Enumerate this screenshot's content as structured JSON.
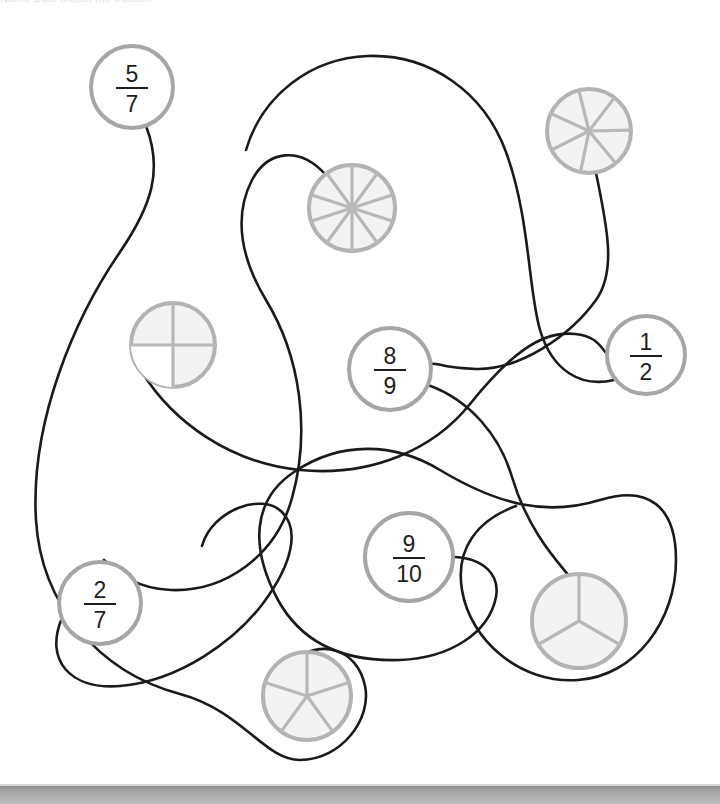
{
  "page": {
    "type": "fraction-matching-worksheet",
    "width": 720,
    "height": 804,
    "background_color": "#ffffff",
    "top_text_fragment": "Name   Date   Match the fraction",
    "bottom_bar_color": "#a9a9a9"
  },
  "style": {
    "connector_color": "#1a1a1a",
    "connector_width": 2.6,
    "fraction_circle_stroke": "#a6a6a6",
    "fraction_circle_fill": "#ffffff",
    "fraction_circle_width": 4,
    "fraction_text_color": "#1d1d1d",
    "pie_fill": "#f3f3f3",
    "pie_stroke": "#b3b3b3",
    "pie_spoke_color": "#b8b8b8",
    "pie_stroke_width": 4
  },
  "fraction_nodes": [
    {
      "id": "f-5-7",
      "label": "5/7",
      "numerator": "5",
      "denominator": "7",
      "cx": 132,
      "cy": 87,
      "r": 41
    },
    {
      "id": "f-1-2",
      "label": "1/2",
      "numerator": "1",
      "denominator": "2",
      "cx": 646,
      "cy": 355,
      "r": 39
    },
    {
      "id": "f-8-9",
      "label": "8/9",
      "numerator": "8",
      "denominator": "9",
      "cx": 390,
      "cy": 369,
      "r": 41
    },
    {
      "id": "f-9-10",
      "label": "9/10",
      "numerator": "9",
      "denominator": "10",
      "cx": 409,
      "cy": 557,
      "r": 44
    },
    {
      "id": "f-2-7",
      "label": "2/7",
      "numerator": "2",
      "denominator": "7",
      "cx": 100,
      "cy": 603,
      "r": 41
    }
  ],
  "pie_nodes": [
    {
      "id": "pie-7",
      "sectors": 7,
      "cx": 589,
      "cy": 131,
      "r": 42,
      "rotation": -14
    },
    {
      "id": "pie-10",
      "sectors": 10,
      "cx": 352,
      "cy": 208,
      "r": 43,
      "rotation": 0
    },
    {
      "id": "pie-4",
      "sectors": 4,
      "cx": 173,
      "cy": 345,
      "r": 42,
      "rotation": 0,
      "shaded_sectors": [
        2
      ]
    },
    {
      "id": "pie-5",
      "sectors": 5,
      "cx": 307,
      "cy": 696,
      "r": 44,
      "rotation": 0
    },
    {
      "id": "pie-3",
      "sectors": 3,
      "cx": 579,
      "cy": 621,
      "r": 47,
      "rotation": 0
    }
  ],
  "connectors": [
    {
      "id": "c-1",
      "from": "f-5-7",
      "to": "pie-5",
      "path": "M 146 126 C 163 170 152 205 120 252 C 76 316 30 420 36 520 C 41 604 98 672 180 694 C 243 711 264 760 300 760 C 342 760 372 718 365 686 C 357 648 320 639 295 660"
    },
    {
      "id": "c-2",
      "from": "pie-10",
      "to": "f-2-7",
      "path": "M 326 175 C 300 146 268 150 252 180 C 232 219 243 262 266 300 C 300 356 311 430 292 498 C 276 556 225 592 171 590 C 138 589 119 574 104 560"
    },
    {
      "id": "c-3",
      "from": "pie-4",
      "to": "f-1-2",
      "path": "M 142 372 C 173 422 230 463 300 470 C 372 477 434 449 470 404 C 508 357 540 330 575 334 C 596 336 600 346 607 354"
    },
    {
      "id": "c-4",
      "from": "pie-7",
      "to": "f-8-9",
      "path": "M 596 173 C 608 230 616 272 596 300 C 570 336 520 370 476 369 C 440 368 437 362 431 364"
    },
    {
      "id": "c-5",
      "from": "f-8-9",
      "to": "pie-3",
      "path": "M 428 385 C 470 400 500 436 512 477 C 528 531 558 562 570 577"
    },
    {
      "id": "c-6",
      "from": "f-9-10",
      "to": "pie-3",
      "path": "M 453 557 C 484 558 500 575 496 597 C 489 633 450 658 400 660 C 340 662 300 640 278 600 C 250 548 252 500 294 472 C 340 441 394 442 440 470 C 500 506 548 516 600 500 C 648 485 676 506 676 560 C 676 620 636 676 578 680 C 520 684 470 640 462 590 C 455 548 478 520 516 506"
    }
  ],
  "standalone_curves": [
    {
      "id": "s-1",
      "path": "M 246 150 C 262 96 310 58 368 56 C 430 54 484 92 506 152 C 530 218 528 288 540 330 C 552 370 580 388 614 380"
    },
    {
      "id": "s-2",
      "path": "M 62 618 C 44 660 70 690 120 686 C 180 681 236 640 264 602 C 292 564 300 530 282 512 C 262 492 212 510 202 546"
    }
  ]
}
